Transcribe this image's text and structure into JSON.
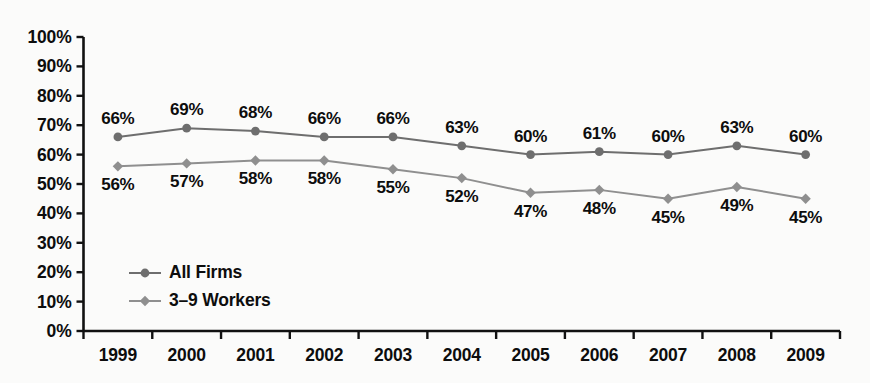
{
  "chart_data": {
    "type": "line",
    "title": "",
    "subtitle": "",
    "xlabel": "",
    "ylabel": "",
    "categories": [
      "1999",
      "2000",
      "2001",
      "2002",
      "2003",
      "2004",
      "2005",
      "2006",
      "2007",
      "2008",
      "2009"
    ],
    "series": [
      {
        "name": "All Firms",
        "marker": "circle",
        "color": "#6e6e6e",
        "values": [
          66,
          69,
          68,
          66,
          66,
          63,
          60,
          61,
          60,
          63,
          60
        ],
        "value_labels": [
          "66%",
          "69%",
          "68%",
          "66%",
          "66%",
          "63%",
          "60%",
          "61%",
          "60%",
          "63%",
          "60%"
        ],
        "label_position": "above"
      },
      {
        "name": "3–9 Workers",
        "marker": "diamond",
        "color": "#8f8f8f",
        "values": [
          56,
          57,
          58,
          58,
          55,
          52,
          47,
          48,
          45,
          49,
          45
        ],
        "value_labels": [
          "56%",
          "57%",
          "58%",
          "58%",
          "55%",
          "52%",
          "47%",
          "48%",
          "45%",
          "49%",
          "45%"
        ],
        "label_position": "below"
      }
    ],
    "ylim": [
      0,
      100
    ],
    "ytick_values": [
      100,
      90,
      80,
      70,
      60,
      50,
      40,
      30,
      20,
      10,
      0
    ],
    "ytick_labels": [
      "100%",
      "90%",
      "80%",
      "70%",
      "60%",
      "50%",
      "40%",
      "30%",
      "20%",
      "10%",
      "0%"
    ],
    "grid": false,
    "legend_position": "inside-lower-left",
    "axis_color": "#111111",
    "background_color": "#fbfbfa"
  },
  "legend": {
    "entries": [
      {
        "label": "All Firms",
        "marker": "circle",
        "color": "#6e6e6e"
      },
      {
        "label": "3–9 Workers",
        "marker": "diamond",
        "color": "#8f8f8f"
      }
    ]
  }
}
